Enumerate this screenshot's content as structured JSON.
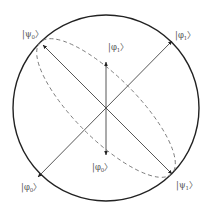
{
  "diagram": {
    "type": "bloch-sphere-projection",
    "colors": {
      "circle": "#222222",
      "arrows": "#444444",
      "dashed_ellipse": "#777777",
      "labels": "#555555",
      "background": "#ffffff"
    },
    "circle": {
      "cx": 106,
      "cy": 108,
      "r": 93
    },
    "ellipse": {
      "cx": 106,
      "cy": 108,
      "rx": 93,
      "ry": 31,
      "rotate": 45
    },
    "arrows": [
      {
        "name": "psi-axis",
        "from": [
          106,
          108
        ],
        "to_a": [
          43,
          45
        ],
        "to_b": [
          172,
          174
        ]
      },
      {
        "name": "phi-diagonal",
        "from": [
          106,
          108
        ],
        "to_a": [
          172,
          41
        ],
        "to_b": [
          38,
          177
        ]
      },
      {
        "name": "phi-vertical",
        "from": [
          106,
          108
        ],
        "to_a": [
          106,
          62
        ],
        "to_b": [
          106,
          155
        ]
      }
    ],
    "labels": {
      "psi0": {
        "base": "ψ",
        "sub": "0",
        "x": 22,
        "y": 37
      },
      "psi1": {
        "base": "ψ",
        "sub": "1",
        "x": 176,
        "y": 188
      },
      "phi1_outer": {
        "base": "φ",
        "sub": "1",
        "x": 175,
        "y": 38
      },
      "phi0_outer": {
        "base": "φ",
        "sub": "0",
        "x": 21,
        "y": 190
      },
      "phi1_inner": {
        "base": "φ",
        "sub": "1",
        "x": 108,
        "y": 50
      },
      "phi0_inner": {
        "base": "φ",
        "sub": "0",
        "x": 92,
        "y": 170
      }
    }
  }
}
